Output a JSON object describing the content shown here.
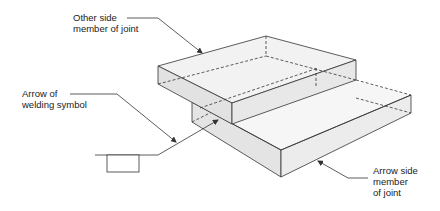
{
  "labels": {
    "other_side": {
      "line1": "Other side",
      "line2": "member of joint"
    },
    "arrow_of_symbol": {
      "line1": "Arrow of",
      "line2": "welding symbol"
    },
    "arrow_side": {
      "line1": "Arrow side",
      "line2": "member",
      "line3": "of joint"
    }
  },
  "colors": {
    "stroke": "#333333",
    "face_light": "#f4f4f4",
    "face_mid": "#e6e6e6",
    "face_dark": "#dcdcdc",
    "background": "#ffffff"
  }
}
